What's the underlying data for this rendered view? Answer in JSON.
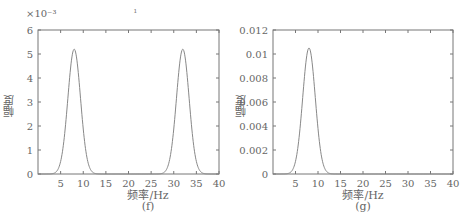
{
  "chart_data": [
    {
      "type": "line",
      "panel": "(f)",
      "xlabel": "频率/Hz",
      "ylabel": "幅度",
      "y_multiplier_label": "×10⁻³",
      "xlim": [
        0,
        40
      ],
      "ylim": [
        0,
        6
      ],
      "xticks": [
        5,
        10,
        15,
        20,
        25,
        30,
        35,
        40
      ],
      "yticks": [
        0,
        1,
        2,
        3,
        4,
        5,
        6
      ],
      "ytick_labels": [
        "0",
        "1",
        "2",
        "3",
        "4",
        "5",
        "6"
      ],
      "grid": false,
      "series": [
        {
          "name": "spectrum",
          "color": "#888888",
          "peaks": [
            {
              "center_hz": 8,
              "amplitude": 5.2,
              "sigma_hz": 1.4
            },
            {
              "center_hz": 32,
              "amplitude": 5.2,
              "sigma_hz": 1.4
            }
          ]
        }
      ]
    },
    {
      "type": "line",
      "panel": "(g)",
      "xlabel": "频率/Hz",
      "ylabel": "幅度",
      "xlim": [
        0,
        40
      ],
      "ylim": [
        0,
        0.012
      ],
      "xticks": [
        5,
        10,
        15,
        20,
        25,
        30,
        35,
        40
      ],
      "yticks": [
        0,
        0.002,
        0.004,
        0.006,
        0.008,
        0.01,
        0.012
      ],
      "ytick_labels": [
        "0",
        "0.002",
        "0.004",
        "0.006",
        "0.008",
        "0.01",
        "0.012"
      ],
      "grid": false,
      "series": [
        {
          "name": "spectrum",
          "color": "#888888",
          "peaks": [
            {
              "center_hz": 8,
              "amplitude": 0.0105,
              "sigma_hz": 1.4
            }
          ]
        }
      ]
    }
  ],
  "panels": {
    "f": {
      "caption": "(f)",
      "xlabel": "频率/Hz",
      "ylabel": "幅度",
      "multiplier": "×10⁻³"
    },
    "g": {
      "caption": "(g)",
      "xlabel": "频率/Hz",
      "ylabel": "幅度"
    }
  },
  "stray_mark": "ı"
}
